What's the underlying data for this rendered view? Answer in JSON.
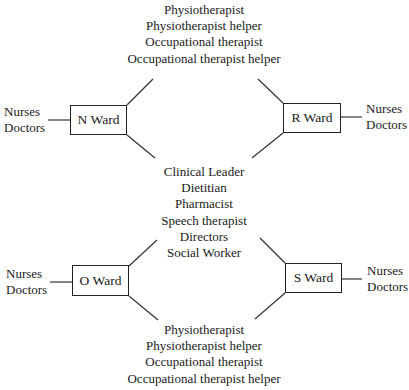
{
  "diagram": {
    "top_group": [
      "Physiotherapist",
      "Physiotherapist helper",
      "Occupational therapist",
      "Occupational therapist helper"
    ],
    "center_group": [
      "Clinical Leader",
      "Dietitian",
      "Pharmacist",
      "Speech therapist",
      "Directors",
      "Social Worker"
    ],
    "bottom_group": [
      "Physiotherapist",
      "Physiotherapist helper",
      "Occupational therapist",
      "Occupational therapist helper"
    ],
    "wards": {
      "n": {
        "label": "N Ward",
        "staff": [
          "Nurses",
          "Doctors"
        ]
      },
      "r": {
        "label": "R Ward",
        "staff": [
          "Nurses",
          "Doctors"
        ]
      },
      "o": {
        "label": "O Ward",
        "staff": [
          "Nurses",
          "Doctors"
        ]
      },
      "s": {
        "label": "S Ward",
        "staff": [
          "Nurses",
          "Doctors"
        ]
      }
    }
  }
}
